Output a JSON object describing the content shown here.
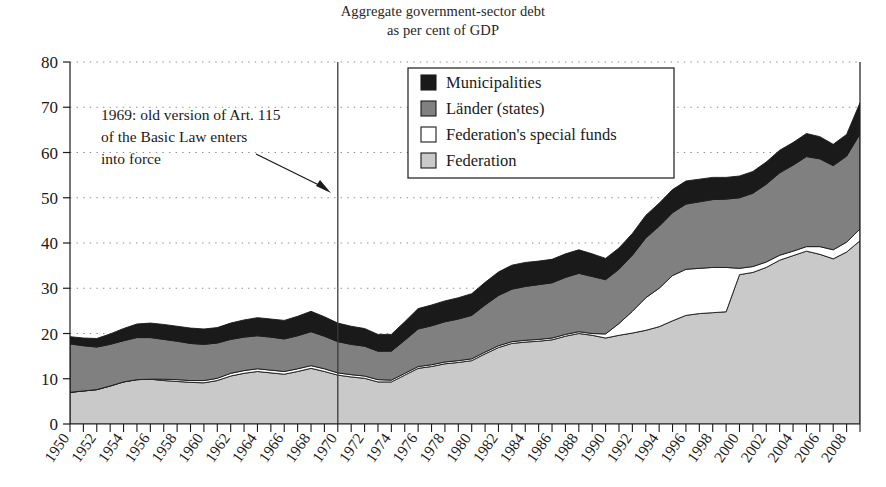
{
  "title": {
    "line1": "Aggregate government-sector debt",
    "line2": "as per cent of GDP"
  },
  "annotation": {
    "line1": "1969: old version of Art. 115",
    "line2": "of the Basic Law enters",
    "line3": "into force",
    "marker_year": 1969
  },
  "legend": {
    "entries": [
      {
        "label": "Municipalities",
        "color": "#1a1a1a"
      },
      {
        "label": "Länder (states)",
        "color": "#808080"
      },
      {
        "label": "Federation's special funds",
        "color": "#ffffff"
      },
      {
        "label": "Federation",
        "color": "#c9c9c9"
      }
    ]
  },
  "axes": {
    "y_ticks": [
      0,
      10,
      20,
      30,
      40,
      50,
      60,
      70,
      80
    ],
    "y_min": 0,
    "y_max": 80,
    "x_min": 1950,
    "x_max": 2009,
    "x_tick_labels": [
      "1950",
      "1952",
      "1954",
      "1956",
      "1958",
      "1960",
      "1962",
      "1964",
      "1966",
      "1968",
      "1970",
      "1972",
      "1974",
      "1976",
      "1978",
      "1980",
      "1982",
      "1984",
      "1986",
      "1988",
      "1990",
      "1992",
      "1994",
      "1996",
      "1998",
      "2000",
      "2002",
      "2004",
      "2006",
      "2008"
    ]
  },
  "chart_data": {
    "type": "area",
    "title": "Aggregate government-sector debt as per cent of GDP",
    "xlabel": "",
    "ylabel": "",
    "ylim": [
      0,
      80
    ],
    "xlim": [
      1950,
      2009
    ],
    "grid": true,
    "legend_position": "top-center",
    "stacked": true,
    "stack_order_bottom_to_top": [
      "Federation",
      "Federation's special funds",
      "Länder (states)",
      "Municipalities"
    ],
    "x": [
      1950,
      1951,
      1952,
      1953,
      1954,
      1955,
      1956,
      1957,
      1958,
      1959,
      1960,
      1961,
      1962,
      1963,
      1964,
      1965,
      1966,
      1967,
      1968,
      1969,
      1970,
      1971,
      1972,
      1973,
      1974,
      1975,
      1976,
      1977,
      1978,
      1979,
      1980,
      1981,
      1982,
      1983,
      1984,
      1985,
      1986,
      1987,
      1988,
      1989,
      1990,
      1991,
      1992,
      1993,
      1994,
      1995,
      1996,
      1997,
      1998,
      1999,
      2000,
      2001,
      2002,
      2003,
      2004,
      2005,
      2006,
      2007,
      2008,
      2009
    ],
    "series": [
      {
        "name": "Federation",
        "color": "#c9c9c9",
        "values": [
          7.0,
          7.3,
          7.6,
          8.4,
          9.3,
          9.8,
          9.9,
          9.6,
          9.4,
          9.2,
          9.1,
          9.6,
          10.6,
          11.2,
          11.6,
          11.3,
          11.0,
          11.6,
          12.3,
          11.6,
          10.8,
          10.4,
          10.1,
          9.3,
          9.3,
          10.8,
          12.3,
          12.7,
          13.3,
          13.6,
          14.0,
          15.5,
          16.9,
          17.8,
          18.1,
          18.3,
          18.6,
          19.4,
          20.0,
          19.6,
          19.0,
          19.6,
          20.1,
          20.7,
          21.5,
          22.8,
          24.0,
          24.4,
          24.6,
          24.8,
          33.0,
          33.5,
          34.6,
          36.2,
          37.2,
          38.2,
          37.5,
          36.5,
          38.0,
          40.5
        ]
      },
      {
        "name": "Federation's special funds",
        "color": "#ffffff",
        "values": [
          0.0,
          0.0,
          0.0,
          0.0,
          0.0,
          0.0,
          0.0,
          0.3,
          0.4,
          0.4,
          0.5,
          0.5,
          0.6,
          0.6,
          0.6,
          0.6,
          0.6,
          0.6,
          0.6,
          0.6,
          0.5,
          0.5,
          0.5,
          0.5,
          0.4,
          0.4,
          0.4,
          0.4,
          0.4,
          0.4,
          0.4,
          0.4,
          0.4,
          0.4,
          0.4,
          0.4,
          0.4,
          0.4,
          0.4,
          0.4,
          0.9,
          2.6,
          4.8,
          7.2,
          8.5,
          10.0,
          10.2,
          10.0,
          10.0,
          9.8,
          1.4,
          1.3,
          1.2,
          1.1,
          1.0,
          1.0,
          1.7,
          2.0,
          2.2,
          2.6
        ]
      },
      {
        "name": "Länder (states)",
        "color": "#808080",
        "values": [
          10.7,
          10.0,
          9.4,
          9.2,
          9.1,
          9.3,
          9.2,
          8.8,
          8.5,
          8.2,
          8.0,
          7.8,
          7.5,
          7.4,
          7.3,
          7.3,
          7.2,
          7.3,
          7.5,
          7.2,
          6.9,
          6.7,
          6.6,
          6.3,
          6.4,
          7.3,
          8.3,
          8.6,
          8.9,
          9.2,
          9.6,
          10.4,
          11.1,
          11.6,
          11.9,
          12.1,
          12.2,
          12.6,
          12.9,
          12.6,
          12.0,
          12.0,
          12.4,
          13.2,
          13.7,
          13.9,
          14.4,
          14.7,
          15.0,
          15.1,
          15.6,
          16.2,
          17.2,
          18.2,
          19.0,
          19.9,
          19.4,
          18.6,
          19.0,
          21.0
        ]
      },
      {
        "name": "Municipalities",
        "color": "#1a1a1a",
        "values": [
          1.6,
          1.7,
          1.9,
          2.3,
          2.7,
          3.0,
          3.2,
          3.3,
          3.3,
          3.4,
          3.4,
          3.4,
          3.6,
          3.8,
          4.0,
          4.0,
          4.1,
          4.3,
          4.5,
          4.3,
          4.1,
          4.0,
          3.9,
          3.7,
          3.7,
          4.1,
          4.5,
          4.6,
          4.6,
          4.7,
          4.8,
          5.0,
          5.2,
          5.3,
          5.3,
          5.2,
          5.2,
          5.2,
          5.2,
          5.0,
          4.7,
          4.7,
          4.8,
          5.0,
          5.1,
          5.1,
          5.1,
          5.0,
          4.9,
          4.8,
          4.8,
          4.8,
          4.9,
          5.0,
          5.0,
          5.1,
          4.9,
          4.7,
          4.8,
          6.9
        ]
      }
    ],
    "totals_note": "Sum of the four stacked components equals total general government debt."
  }
}
